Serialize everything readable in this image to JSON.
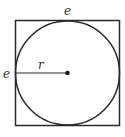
{
  "diagram": {
    "labels": {
      "top_edge": "e",
      "left_edge": "e",
      "radius": "r"
    },
    "colors": {
      "stroke": "#2a2a2a",
      "text": "#333333"
    }
  }
}
